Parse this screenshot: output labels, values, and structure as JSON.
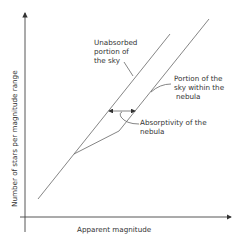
{
  "diagram": {
    "y_axis_label": "Number of stars per magnitude range",
    "x_axis_label": "Apparent magnitude",
    "annotations": {
      "unabsorbed": [
        "Unabsorbed",
        "portion of",
        "the sky"
      ],
      "within_nebula": [
        "Portion of the",
        "sky within the",
        "nebula"
      ],
      "absorptivity": [
        "Absorptivity of the",
        "nebula"
      ]
    },
    "colors": {
      "line": "#666666",
      "text": "#333333",
      "background": "#ffffff"
    }
  }
}
